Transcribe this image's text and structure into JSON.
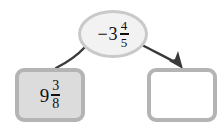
{
  "diagram": {
    "type": "flow-diagram",
    "background_color": "#ffffff",
    "operation_node": {
      "shape": "ellipse",
      "sign": "−",
      "whole": "3",
      "numerator": "4",
      "denominator": "5",
      "full_text": "−3 4/5",
      "fill_color": "#f2f2f2",
      "border_color": "#c9c9c9"
    },
    "input_node": {
      "shape": "rounded-rectangle",
      "sign": "",
      "whole": "9",
      "numerator": "3",
      "denominator": "8",
      "full_text": "9 3/8",
      "fill_color": "#dcdcdc",
      "border_color": "#b4b4b4"
    },
    "output_node": {
      "shape": "rounded-rectangle",
      "value": "",
      "full_text": "",
      "fill_color": "#ffffff",
      "border_color": "#b4b4b4"
    },
    "connectors": [
      {
        "name": "input-to-operation",
        "arrowhead": "none",
        "color": "#3a3a3a"
      },
      {
        "name": "operation-to-output",
        "arrowhead": "end",
        "color": "#3a3a3a"
      }
    ]
  }
}
